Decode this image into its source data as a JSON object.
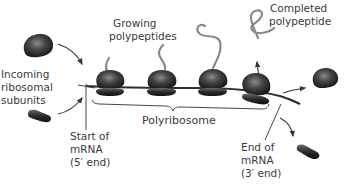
{
  "diagram": {
    "labels": {
      "incoming": [
        "Incoming",
        "ribosomal",
        "subunits"
      ],
      "growing": [
        "Growing",
        "polypeptides"
      ],
      "completed": [
        "Completed",
        "polypeptide"
      ],
      "start": [
        "Start of",
        "mRNA",
        "(5′ end)"
      ],
      "end": [
        "End of",
        "mRNA",
        "(3′ end)"
      ],
      "polyribosome": "Polyribosome"
    },
    "colors": {
      "ribosome_dark": "#1f1f1f",
      "ribosome_highlight": "#7a7a7a",
      "polypeptide": "#8a8a8a",
      "mrna": "#2e2e2e",
      "text": "#3a3a3a"
    },
    "ribosomes_on_mrna": 4
  }
}
